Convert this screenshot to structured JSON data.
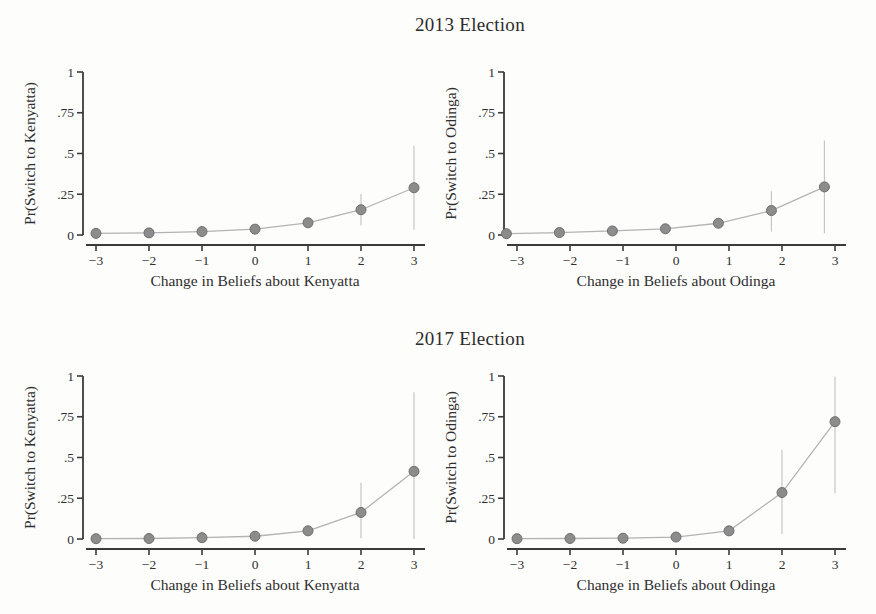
{
  "figure": {
    "background": "#fdfdfc",
    "sections": [
      {
        "title": "2013 Election"
      },
      {
        "title": "2017 Election"
      }
    ]
  },
  "style": {
    "axis_color": "#3a3a3a",
    "text_color": "#2f2f2f",
    "marker_fill": "#8c8c8c",
    "marker_stroke": "#6e6e6e",
    "line_color": "#b3b3b3",
    "ci_color": "#c2c2c2"
  },
  "chart_data": [
    {
      "type": "line",
      "section": "2013 Election",
      "ylabel": "Pr(Switch to Kenyatta)",
      "xlabel": "Change in Beliefs about Kenyatta",
      "x": [
        -3,
        -2,
        -1,
        0,
        1,
        2,
        3
      ],
      "y": [
        0.01,
        0.013,
        0.021,
        0.036,
        0.075,
        0.155,
        0.29
      ],
      "ci_low": [
        0.003,
        0.004,
        0.01,
        0.022,
        0.046,
        0.058,
        0.032
      ],
      "ci_high": [
        0.017,
        0.022,
        0.032,
        0.05,
        0.104,
        0.252,
        0.548
      ],
      "xlim": [
        -3.3,
        3.3
      ],
      "ylim": [
        0,
        1
      ],
      "xticks": [
        -3,
        -2,
        -1,
        0,
        1,
        2,
        3
      ],
      "xtick_labels": [
        "−3",
        "−2",
        "−1",
        "0",
        "1",
        "2",
        "3"
      ],
      "yticks": [
        0,
        0.25,
        0.5,
        0.75,
        1
      ],
      "ytick_labels": [
        "0",
        ".25",
        ".5",
        ".75",
        "1"
      ],
      "grid": false,
      "legend": "none"
    },
    {
      "type": "line",
      "section": "2013 Election",
      "ylabel": "Pr(Switch to Odinga)",
      "xlabel": "Change in Beliefs about Odinga",
      "x": [
        -3.2,
        -2.2,
        -1.2,
        -0.2,
        0.8,
        1.8,
        2.8
      ],
      "y": [
        0.008,
        0.015,
        0.025,
        0.038,
        0.072,
        0.15,
        0.295
      ],
      "ci_low": [
        0.002,
        0.006,
        0.013,
        0.024,
        0.044,
        0.022,
        0.01
      ],
      "ci_high": [
        0.014,
        0.024,
        0.037,
        0.052,
        0.1,
        0.268,
        0.58
      ],
      "xlim": [
        -3.3,
        3.3
      ],
      "ylim": [
        0,
        1
      ],
      "xticks": [
        -3,
        -2,
        -1,
        0,
        1,
        2,
        3
      ],
      "xtick_labels": [
        "−3",
        "−2",
        "−1",
        "0",
        "1",
        "2",
        "3"
      ],
      "yticks": [
        0,
        0.25,
        0.5,
        0.75,
        1
      ],
      "ytick_labels": [
        "0",
        ".25",
        ".5",
        ".75",
        "1"
      ],
      "grid": false,
      "legend": "none"
    },
    {
      "type": "line",
      "section": "2017 Election",
      "ylabel": "Pr(Switch to Kenyatta)",
      "xlabel": "Change in Beliefs about Kenyatta",
      "x": [
        -3,
        -2,
        -1,
        0,
        1,
        2,
        3
      ],
      "y": [
        0.002,
        0.003,
        0.008,
        0.017,
        0.05,
        0.163,
        0.415
      ],
      "ci_low": [
        0.0,
        0.0,
        0.002,
        0.006,
        0.022,
        0.005,
        0.0
      ],
      "ci_high": [
        0.005,
        0.008,
        0.015,
        0.029,
        0.085,
        0.345,
        0.9
      ],
      "xlim": [
        -3.3,
        3.3
      ],
      "ylim": [
        0,
        1
      ],
      "xticks": [
        -3,
        -2,
        -1,
        0,
        1,
        2,
        3
      ],
      "xtick_labels": [
        "−3",
        "−2",
        "−1",
        "0",
        "1",
        "2",
        "3"
      ],
      "yticks": [
        0,
        0.25,
        0.5,
        0.75,
        1
      ],
      "ytick_labels": [
        "0",
        ".25",
        ".5",
        ".75",
        "1"
      ],
      "grid": false,
      "legend": "none"
    },
    {
      "type": "line",
      "section": "2017 Election",
      "ylabel": "Pr(Switch to Odinga)",
      "xlabel": "Change in Beliefs about Odinga",
      "x": [
        -3,
        -2,
        -1,
        0,
        1,
        2,
        3
      ],
      "y": [
        0.002,
        0.003,
        0.005,
        0.012,
        0.05,
        0.285,
        0.72
      ],
      "ci_low": [
        0.0,
        0.0,
        0.001,
        0.004,
        0.025,
        0.03,
        0.28
      ],
      "ci_high": [
        0.005,
        0.007,
        0.011,
        0.022,
        0.08,
        0.548,
        0.995
      ],
      "xlim": [
        -3.3,
        3.3
      ],
      "ylim": [
        0,
        1
      ],
      "xticks": [
        -3,
        -2,
        -1,
        0,
        1,
        2,
        3
      ],
      "xtick_labels": [
        "−3",
        "−2",
        "−1",
        "0",
        "1",
        "2",
        "3"
      ],
      "yticks": [
        0,
        0.25,
        0.5,
        0.75,
        1
      ],
      "ytick_labels": [
        "0",
        ".25",
        ".5",
        ".75",
        "1"
      ],
      "grid": false,
      "legend": "none"
    }
  ]
}
